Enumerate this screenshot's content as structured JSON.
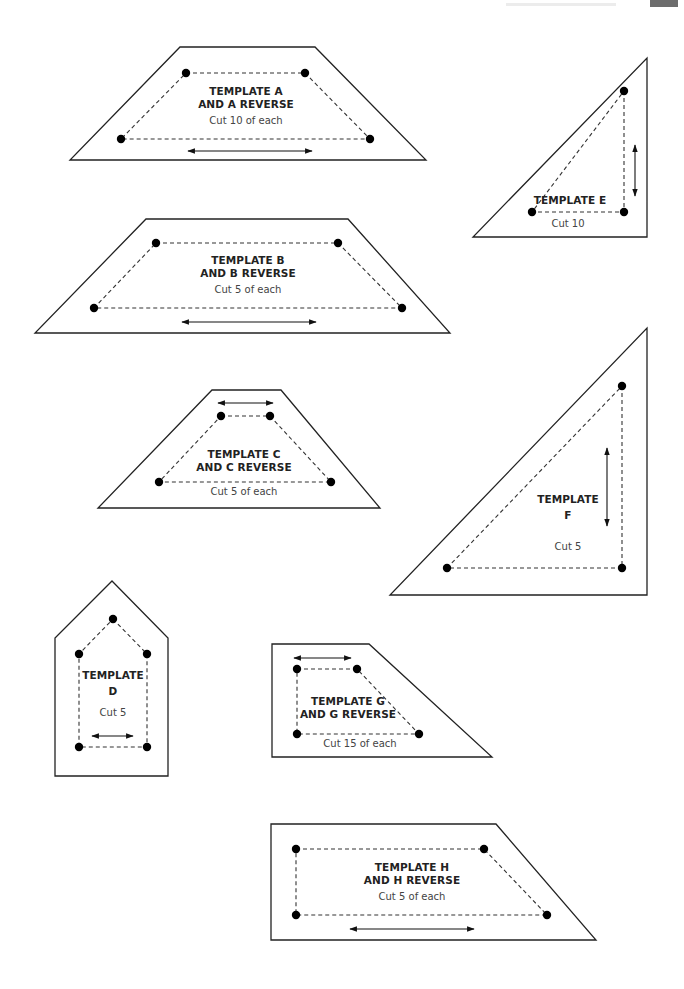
{
  "header": {
    "running_title": "",
    "page_tab": ""
  },
  "templates": [
    {
      "id": "A",
      "title_line1": "TEMPLATE A",
      "title_line2": "AND A REVERSE",
      "cut": "Cut 10 of each",
      "grain": "horizontal"
    },
    {
      "id": "E",
      "title_line1": "TEMPLATE E",
      "title_line2": "",
      "cut": "Cut 10",
      "grain": "vertical"
    },
    {
      "id": "B",
      "title_line1": "TEMPLATE B",
      "title_line2": "AND B REVERSE",
      "cut": "Cut 5 of each",
      "grain": "horizontal"
    },
    {
      "id": "C",
      "title_line1": "TEMPLATE C",
      "title_line2": "AND C REVERSE",
      "cut": "Cut 5 of each",
      "grain": "horizontal"
    },
    {
      "id": "F",
      "title_line1": "TEMPLATE",
      "title_line2": "F",
      "cut": "Cut 5",
      "grain": "vertical"
    },
    {
      "id": "D",
      "title_line1": "TEMPLATE",
      "title_line2": "D",
      "cut": "Cut 5",
      "grain": "horizontal"
    },
    {
      "id": "G",
      "title_line1": "TEMPLATE G",
      "title_line2": "AND G REVERSE",
      "cut": "Cut 15 of each",
      "grain": "horizontal"
    },
    {
      "id": "H",
      "title_line1": "TEMPLATE H",
      "title_line2": "AND H REVERSE",
      "cut": "Cut 5 of each",
      "grain": "horizontal"
    }
  ],
  "colors": {
    "outline": "#222222",
    "seam": "#333333",
    "dot": "#000000",
    "tab": "#6d6d6d"
  }
}
